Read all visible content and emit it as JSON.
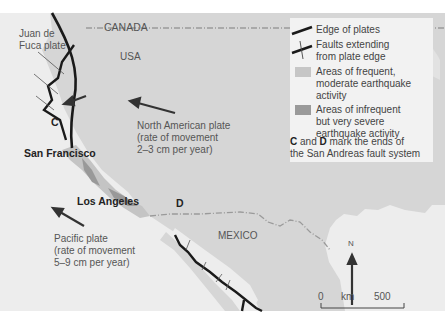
{
  "map": {
    "countries": {
      "canada": "CANADA",
      "usa": "USA",
      "mexico": "MEXICO"
    },
    "plates": {
      "juan_de_fuca": [
        "Juan de",
        "Fuca plate"
      ],
      "north_american": [
        "North American plate",
        "(rate of movement",
        "2–3 cm per year)"
      ],
      "pacific": [
        "Pacific plate",
        "(rate of movement",
        "5–9 cm per year)"
      ]
    },
    "cities": {
      "san_francisco": "San Francisco",
      "los_angeles": "Los Angeles"
    },
    "markers": {
      "c": "C",
      "d": "D"
    },
    "north_label": "N",
    "scale": {
      "zero": "0",
      "unit": "km",
      "max": "500"
    },
    "colors": {
      "land": "#d7d7d7",
      "sea": "#eeeeee",
      "frequent_zone": "#c6c6c6",
      "severe_zone": "#9a9a9a",
      "plate_edge": "#1a1a1a",
      "border": "#999999"
    }
  },
  "legend": {
    "items": [
      {
        "label": [
          "Edge of plates"
        ]
      },
      {
        "label": [
          "Faults extending",
          "from plate edge"
        ]
      },
      {
        "label": [
          "Areas of frequent,",
          "moderate earthquake",
          "activity"
        ]
      },
      {
        "label": [
          "Areas of infrequent",
          "but very severe",
          "earthquake activity"
        ]
      }
    ],
    "note": {
      "c": "C",
      "and": " and ",
      "d": "D",
      "line1_rest": " mark the ends of",
      "line2": "the San Andreas fault system"
    }
  }
}
